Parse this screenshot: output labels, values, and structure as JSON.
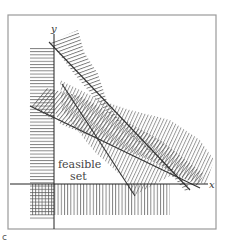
{
  "figure": {
    "type": "linear-program-feasible-set",
    "axes": {
      "x_label": "x",
      "y_label": "y"
    },
    "region_label_line1": "feasible",
    "region_label_line2": "set",
    "corner_mark": "c",
    "constraints": [
      {
        "name": "x >= 0",
        "hatch": "horizontal",
        "shaded_side": "left of y-axis"
      },
      {
        "name": "y >= 0",
        "hatch": "vertical",
        "shaded_side": "below x-axis"
      },
      {
        "name": "constraint-1",
        "hatch": "horizontal",
        "shaded_side": "upper-right"
      },
      {
        "name": "constraint-2",
        "hatch": "diagonal",
        "shaded_side": "upper-right"
      },
      {
        "name": "constraint-3",
        "hatch": "vertical",
        "shaded_side": "upper-right"
      }
    ],
    "colors": {
      "line": "#333333",
      "hatch": "#555555",
      "frame": "#9a9a9a",
      "background": "#ffffff"
    }
  }
}
